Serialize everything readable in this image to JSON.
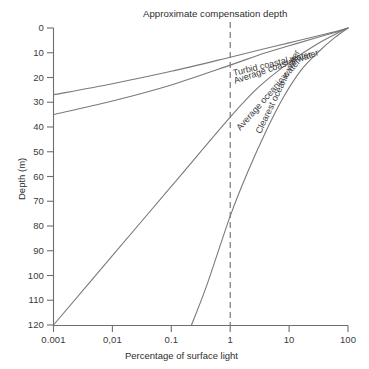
{
  "chart_data": {
    "type": "line",
    "title": "",
    "annotation": "Approximate compensation depth",
    "xlabel": "Percentage of surface light",
    "ylabel": "Depth (m)",
    "xscale": "log",
    "xlim": [
      0.001,
      100
    ],
    "ylim": [
      120,
      0
    ],
    "y_inverted": true,
    "grid": false,
    "legend": "inline-curve-labels",
    "xticks": [
      {
        "value": 0.001,
        "label": "0.001"
      },
      {
        "value": 0.01,
        "label": "0,01"
      },
      {
        "value": 0.1,
        "label": "0.1"
      },
      {
        "value": 1,
        "label": "1"
      },
      {
        "value": 10,
        "label": "10"
      },
      {
        "value": 100,
        "label": "100"
      }
    ],
    "yticks": [
      {
        "value": 0,
        "label": "0"
      },
      {
        "value": 10,
        "label": "10"
      },
      {
        "value": 20,
        "label": "20"
      },
      {
        "value": 30,
        "label": "30"
      },
      {
        "value": 40,
        "label": "40"
      },
      {
        "value": 50,
        "label": "50"
      },
      {
        "value": 60,
        "label": "60"
      },
      {
        "value": 70,
        "label": "70"
      },
      {
        "value": 80,
        "label": "80"
      },
      {
        "value": 90,
        "label": "90"
      },
      {
        "value": 100,
        "label": "100"
      },
      {
        "value": 110,
        "label": "110"
      },
      {
        "value": 120,
        "label": "120"
      }
    ],
    "reference_lines": [
      {
        "name": "compensation-depth",
        "axis": "x",
        "value": 1,
        "style": "dashed",
        "label": "Approximate compensation depth"
      }
    ],
    "series": [
      {
        "name": "Turbid coastal water",
        "label": "Turbid coastal water",
        "points": [
          {
            "light": 0.001,
            "depth": 27.0
          },
          {
            "light": 0.01,
            "depth": 22.5
          },
          {
            "light": 0.1,
            "depth": 17.5
          },
          {
            "light": 1,
            "depth": 11.8
          },
          {
            "light": 3,
            "depth": 9.0
          },
          {
            "light": 10,
            "depth": 6.0
          },
          {
            "light": 30,
            "depth": 3.2
          },
          {
            "light": 60,
            "depth": 1.5
          },
          {
            "light": 100,
            "depth": 0
          }
        ]
      },
      {
        "name": "Average coastal water",
        "label": "Average coastal water",
        "points": [
          {
            "light": 0.001,
            "depth": 35.0
          },
          {
            "light": 0.01,
            "depth": 29.5
          },
          {
            "light": 0.1,
            "depth": 23.0
          },
          {
            "light": 1,
            "depth": 15.0
          },
          {
            "light": 3,
            "depth": 11.0
          },
          {
            "light": 10,
            "depth": 7.2
          },
          {
            "light": 30,
            "depth": 3.8
          },
          {
            "light": 60,
            "depth": 1.8
          },
          {
            "light": 100,
            "depth": 0
          }
        ]
      },
      {
        "name": "Average oceanic water",
        "label": "Average oceanic water",
        "points": [
          {
            "light": 0.001,
            "depth": 120.0
          },
          {
            "light": 0.01,
            "depth": 92.0
          },
          {
            "light": 0.1,
            "depth": 64.0
          },
          {
            "light": 1,
            "depth": 36.0
          },
          {
            "light": 3,
            "depth": 24.0
          },
          {
            "light": 10,
            "depth": 14.0
          },
          {
            "light": 30,
            "depth": 6.5
          },
          {
            "light": 60,
            "depth": 2.6
          },
          {
            "light": 100,
            "depth": 0
          }
        ]
      },
      {
        "name": "Clearest oceanic water",
        "label": "Clearest oceanic water",
        "points": [
          {
            "light": 0.22,
            "depth": 120.0
          },
          {
            "light": 0.4,
            "depth": 104.0
          },
          {
            "light": 1,
            "depth": 76.0
          },
          {
            "light": 2,
            "depth": 58.0
          },
          {
            "light": 4,
            "depth": 42.0
          },
          {
            "light": 8,
            "depth": 28.0
          },
          {
            "light": 16,
            "depth": 17.0
          },
          {
            "light": 32,
            "depth": 9.5
          },
          {
            "light": 60,
            "depth": 3.8
          },
          {
            "light": 100,
            "depth": 0
          }
        ]
      }
    ],
    "colors": {
      "curve": "#7a7a7a",
      "axis": "#6e6e6e",
      "reference": "#6b6b6b",
      "text": "#2e2e2e",
      "background": "#ffffff"
    }
  }
}
